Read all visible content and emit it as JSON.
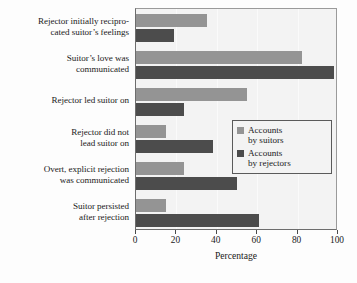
{
  "chart_data": {
    "type": "bar",
    "orientation": "horizontal",
    "title": "",
    "xlabel": "Percentage",
    "ylabel": "",
    "xlim": [
      0,
      100
    ],
    "xticks": [
      0,
      20,
      40,
      60,
      80,
      100
    ],
    "grid": false,
    "legend_position": "center-right",
    "categories": [
      "Rejector initially reciprocated suitor's feelings",
      "Suitor's love was communicated",
      "Rejector led suitor on",
      "Rejector did not lead suitor on",
      "Overt, explicit rejection was communicated",
      "Suitor persisted after rejection"
    ],
    "category_lines": [
      [
        "Rejector initially recipro-",
        "cated suitor’s feelings"
      ],
      [
        "Suitor’s love was",
        "communicated"
      ],
      [
        "Rejector led suitor on"
      ],
      [
        "Rejector did not",
        "lead suitor on"
      ],
      [
        "Overt, explicit rejection",
        "was communicated"
      ],
      [
        "Suitor persisted",
        "after rejection"
      ]
    ],
    "series": [
      {
        "name": "Accounts by suitors",
        "name_lines": [
          "Accounts",
          "by suitors"
        ],
        "color": "#949494",
        "values": [
          35,
          82,
          55,
          15,
          24,
          15
        ]
      },
      {
        "name": "Accounts by rejectors",
        "name_lines": [
          "Accounts",
          "by rejectors"
        ],
        "color": "#4c4c4c",
        "values": [
          19,
          98,
          24,
          38,
          50,
          61
        ]
      }
    ]
  },
  "legend": {
    "entries": [
      {
        "line1": "Accounts",
        "line2": "by suitors"
      },
      {
        "line1": "Accounts",
        "line2": "by rejectors"
      }
    ]
  },
  "axis": {
    "x_title": "Percentage",
    "x_tick_labels": [
      "0",
      "20",
      "40",
      "60",
      "80",
      "100"
    ]
  },
  "colors": {
    "suitors": "#949494",
    "rejectors": "#4c4c4c",
    "plot_background": "#f3f3f3",
    "axis": "#4a4a4a",
    "text": "#1a1a1a"
  }
}
